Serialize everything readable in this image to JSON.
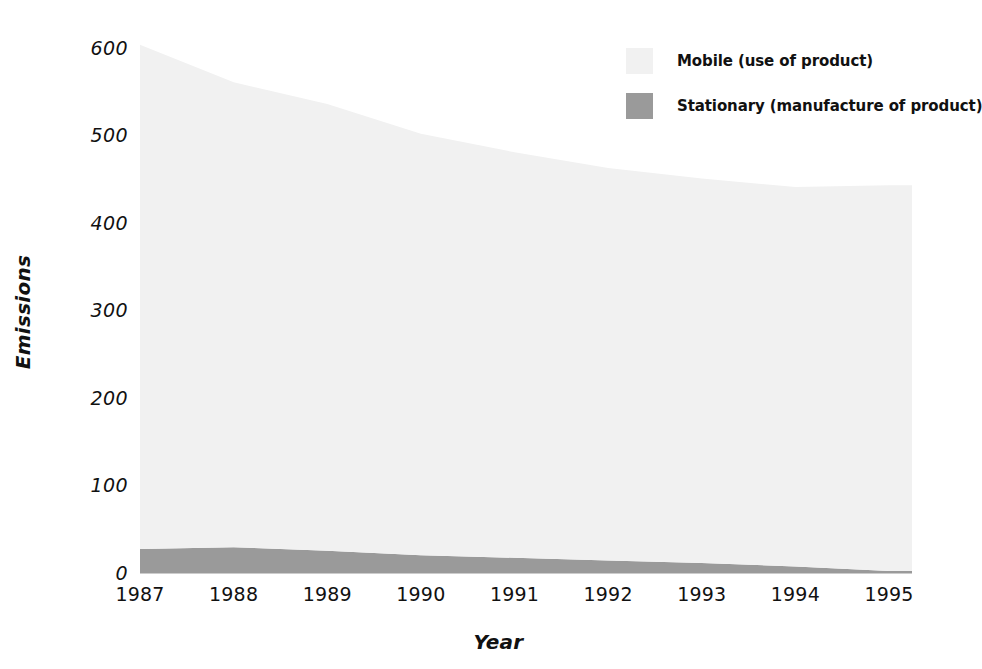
{
  "chart_data": {
    "type": "area",
    "stacked": true,
    "title": "",
    "subtitle": "",
    "xlabel": "Year",
    "ylabel": "Emissions",
    "categories": [
      "1987",
      "1988",
      "1989",
      "1990",
      "1991",
      "1992",
      "1993",
      "1994",
      "1995"
    ],
    "x": [
      1987,
      1988,
      1989,
      1990,
      1991,
      1992,
      1993,
      1994,
      1995
    ],
    "series": [
      {
        "name": "Stationary (manufacture of product)",
        "label": "Stationary (manufacture of product)",
        "color": "#9a9a9a",
        "values": [
          28,
          30,
          26,
          21,
          18,
          15,
          12,
          8,
          3
        ]
      },
      {
        "name": "Mobile (use of product)",
        "label": "Mobile (use of product)",
        "color": "#f1f1f1",
        "values": [
          577,
          532,
          511,
          482,
          464,
          449,
          440,
          434,
          441
        ]
      }
    ],
    "totals": [
      605,
      562,
      537,
      503,
      482,
      464,
      452,
      442,
      444
    ],
    "xlim": [
      1987,
      1995.4
    ],
    "ylim": [
      0,
      600
    ],
    "ytick_values": [
      0,
      100,
      200,
      300,
      400,
      500,
      600
    ],
    "ytick_labels": [
      "0",
      "100",
      "200",
      "300",
      "400",
      "500",
      "600"
    ],
    "grid": false,
    "legend_position": "top-right"
  },
  "axes": {
    "y_title": "Emissions",
    "x_title": "Year",
    "y_ticks": [
      {
        "label": "600",
        "value": 600
      },
      {
        "label": "500",
        "value": 500
      },
      {
        "label": "400",
        "value": 400
      },
      {
        "label": "300",
        "value": 300
      },
      {
        "label": "200",
        "value": 200
      },
      {
        "label": "100",
        "value": 100
      },
      {
        "label": "0",
        "value": 0
      }
    ],
    "x_ticks": [
      {
        "label": "1987"
      },
      {
        "label": "1988"
      },
      {
        "label": "1989"
      },
      {
        "label": "1990"
      },
      {
        "label": "1991"
      },
      {
        "label": "1992"
      },
      {
        "label": "1993"
      },
      {
        "label": "1994"
      },
      {
        "label": "1995"
      }
    ]
  },
  "legend": {
    "items": [
      {
        "label": "Mobile (use of product)",
        "color": "#f1f1f1",
        "swatch_name": "legend-swatch-mobile"
      },
      {
        "label": "Stationary (manufacture of product)",
        "color": "#9a9a9a",
        "swatch_name": "legend-swatch-stationary"
      }
    ]
  },
  "colors": {
    "background": "#ffffff",
    "text": "#111111",
    "mobile": "#f1f1f1",
    "stationary": "#9a9a9a"
  }
}
